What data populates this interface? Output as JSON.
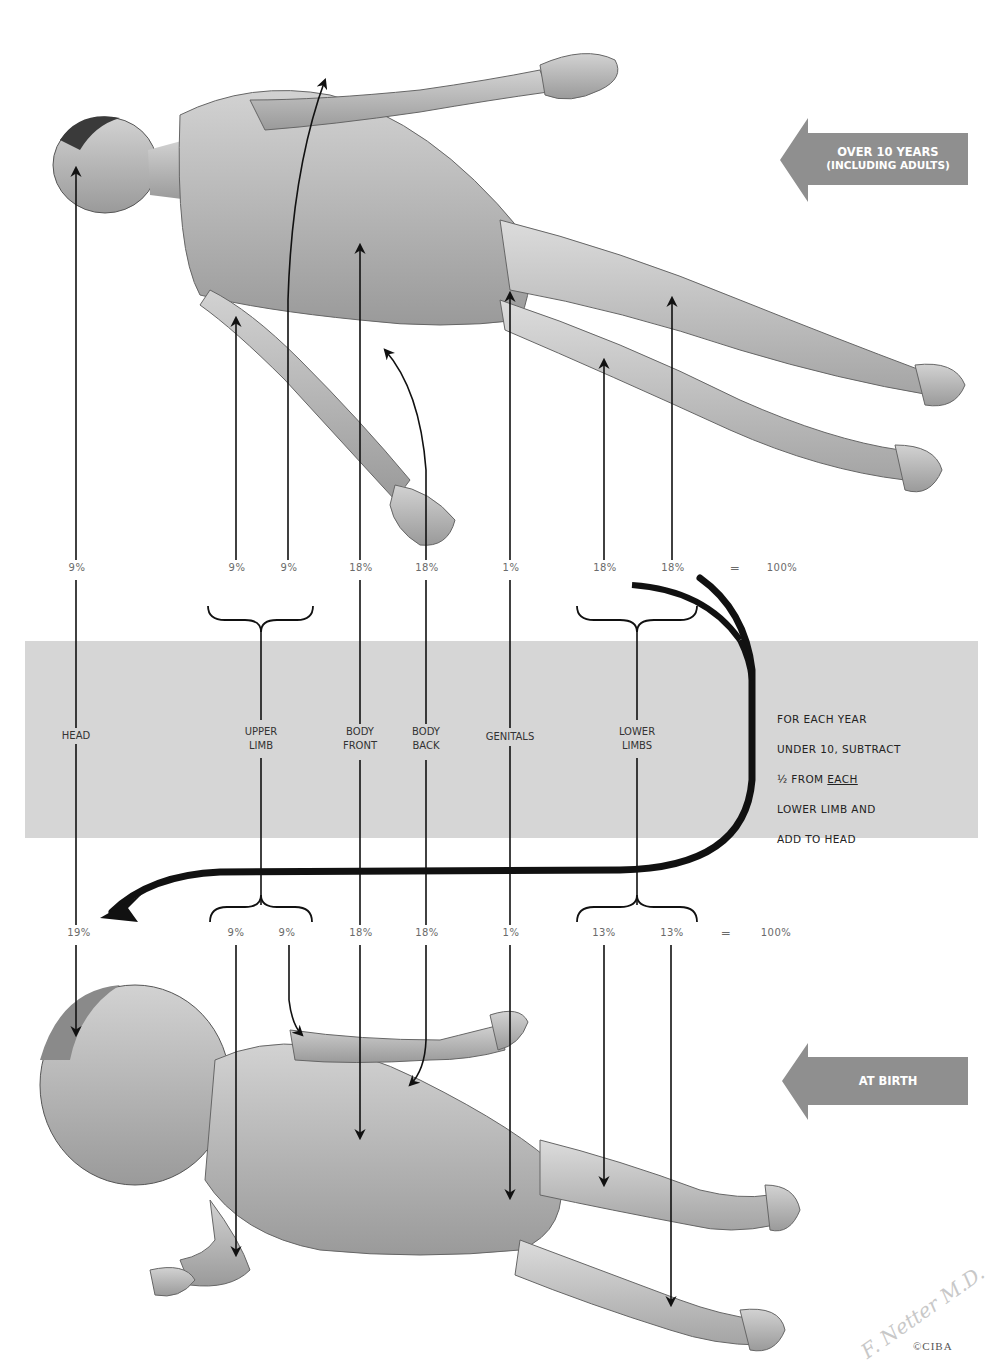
{
  "diagram": {
    "age_tags": {
      "adult": {
        "line1": "OVER 10 YEARS",
        "line2": "(INCLUDING ADULTS)",
        "color": "#8a8a8a"
      },
      "birth": {
        "label": "AT BIRTH",
        "color": "#8a8a8a"
      }
    },
    "regions": [
      {
        "id": "head",
        "label": "HEAD",
        "adult_pct": "9%",
        "birth_pct": "19%"
      },
      {
        "id": "upper-limb",
        "label": "UPPER\nLIMB",
        "adult_pct": [
          "9%",
          "9%"
        ],
        "birth_pct": [
          "9%",
          "9%"
        ]
      },
      {
        "id": "body-front",
        "label": "BODY\nFRONT",
        "adult_pct": "18%",
        "birth_pct": "18%"
      },
      {
        "id": "body-back",
        "label": "BODY\nBACK",
        "adult_pct": "18%",
        "birth_pct": "18%"
      },
      {
        "id": "genitals",
        "label": "GENITALS",
        "adult_pct": "1%",
        "birth_pct": "1%"
      },
      {
        "id": "lower-limbs",
        "label": "LOWER\nLIMBS",
        "adult_pct": [
          "18%",
          "18%"
        ],
        "birth_pct": [
          "13%",
          "13%"
        ]
      }
    ],
    "adult_row": {
      "head": "9%",
      "upper_limb_1": "9%",
      "upper_limb_2": "9%",
      "body_front": "18%",
      "body_back": "18%",
      "genitals": "1%",
      "lower_limb_1": "18%",
      "lower_limb_2": "18%",
      "equals": "=",
      "total": "100%"
    },
    "birth_row": {
      "head": "19%",
      "upper_limb_1": "9%",
      "upper_limb_2": "9%",
      "body_front": "18%",
      "body_back": "18%",
      "genitals": "1%",
      "lower_limb_1": "13%",
      "lower_limb_2": "13%",
      "equals": "=",
      "total": "100%"
    },
    "labels": {
      "head": "HEAD",
      "upper_limb_1": "UPPER",
      "upper_limb_2": "LIMB",
      "body_front_1": "BODY",
      "body_front_2": "FRONT",
      "body_back_1": "BODY",
      "body_back_2": "BACK",
      "genitals": "GENITALS",
      "lower_limbs_1": "LOWER",
      "lower_limbs_2": "LIMBS"
    },
    "note": {
      "line1": "FOR EACH YEAR",
      "line2": "UNDER 10, SUBTRACT",
      "line3_pre": "½ FROM ",
      "line3_underlined": "EACH",
      "line4": "LOWER LIMB AND",
      "line5": "ADD TO HEAD"
    },
    "band_color": "#d6d6d6",
    "signature": "F. Netter M.D.",
    "copyright": "©CIBA"
  }
}
